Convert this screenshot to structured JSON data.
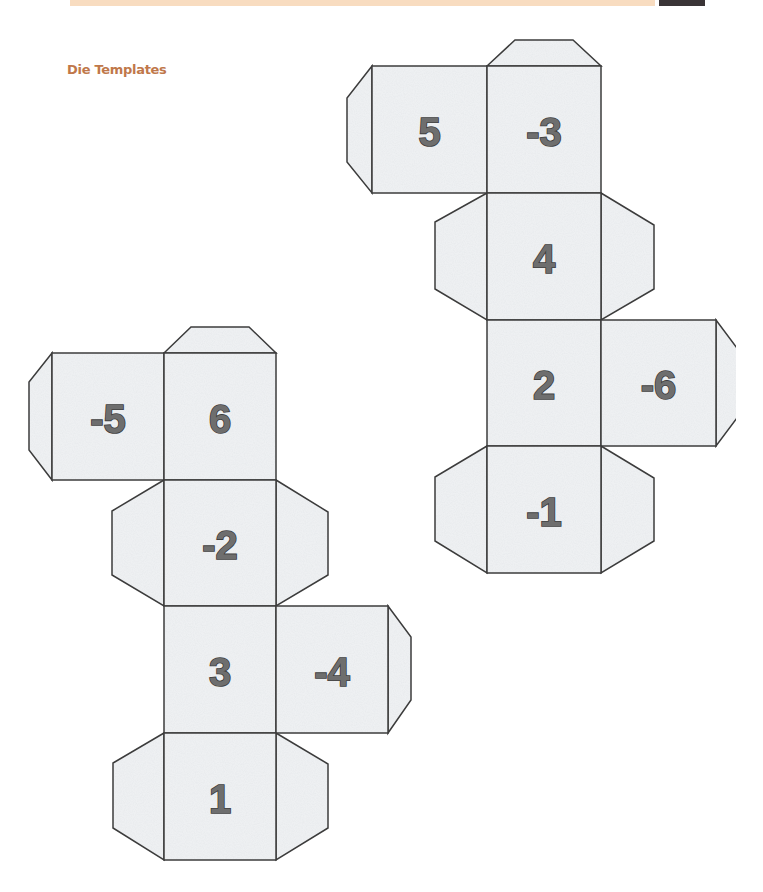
{
  "header": {
    "band_color": "#f8dcc0",
    "dark_block_color": "#3a3436"
  },
  "section": {
    "title": "Die Templates",
    "title_color": "#c0784a"
  },
  "nets": [
    {
      "name": "die-net-right",
      "faces": [
        {
          "label": "5",
          "x": 372,
          "y": 66,
          "w": 115,
          "h": 127
        },
        {
          "label": "-3",
          "x": 487,
          "y": 66,
          "w": 114,
          "h": 127
        },
        {
          "label": "4",
          "x": 487,
          "y": 193,
          "w": 114,
          "h": 127
        },
        {
          "label": "2",
          "x": 487,
          "y": 320,
          "w": 114,
          "h": 126
        },
        {
          "label": "-6",
          "x": 601,
          "y": 320,
          "w": 115,
          "h": 126
        },
        {
          "label": "-1",
          "x": 487,
          "y": 446,
          "w": 114,
          "h": 127
        }
      ]
    },
    {
      "name": "die-net-left",
      "faces": [
        {
          "label": "-5",
          "x": 52,
          "y": 353,
          "w": 112,
          "h": 127
        },
        {
          "label": "6",
          "x": 164,
          "y": 353,
          "w": 112,
          "h": 127
        },
        {
          "label": "-2",
          "x": 164,
          "y": 480,
          "w": 112,
          "h": 126
        },
        {
          "label": "3",
          "x": 164,
          "y": 606,
          "w": 112,
          "h": 127
        },
        {
          "label": "-4",
          "x": 276,
          "y": 606,
          "w": 112,
          "h": 127
        },
        {
          "label": "1",
          "x": 164,
          "y": 733,
          "w": 112,
          "h": 127
        }
      ]
    }
  ],
  "colors": {
    "paper": "#e9ecee",
    "outline": "#3c3c3c",
    "numeral_fill": "#6e6e6e",
    "numeral_stroke": "#3e3e3e"
  }
}
